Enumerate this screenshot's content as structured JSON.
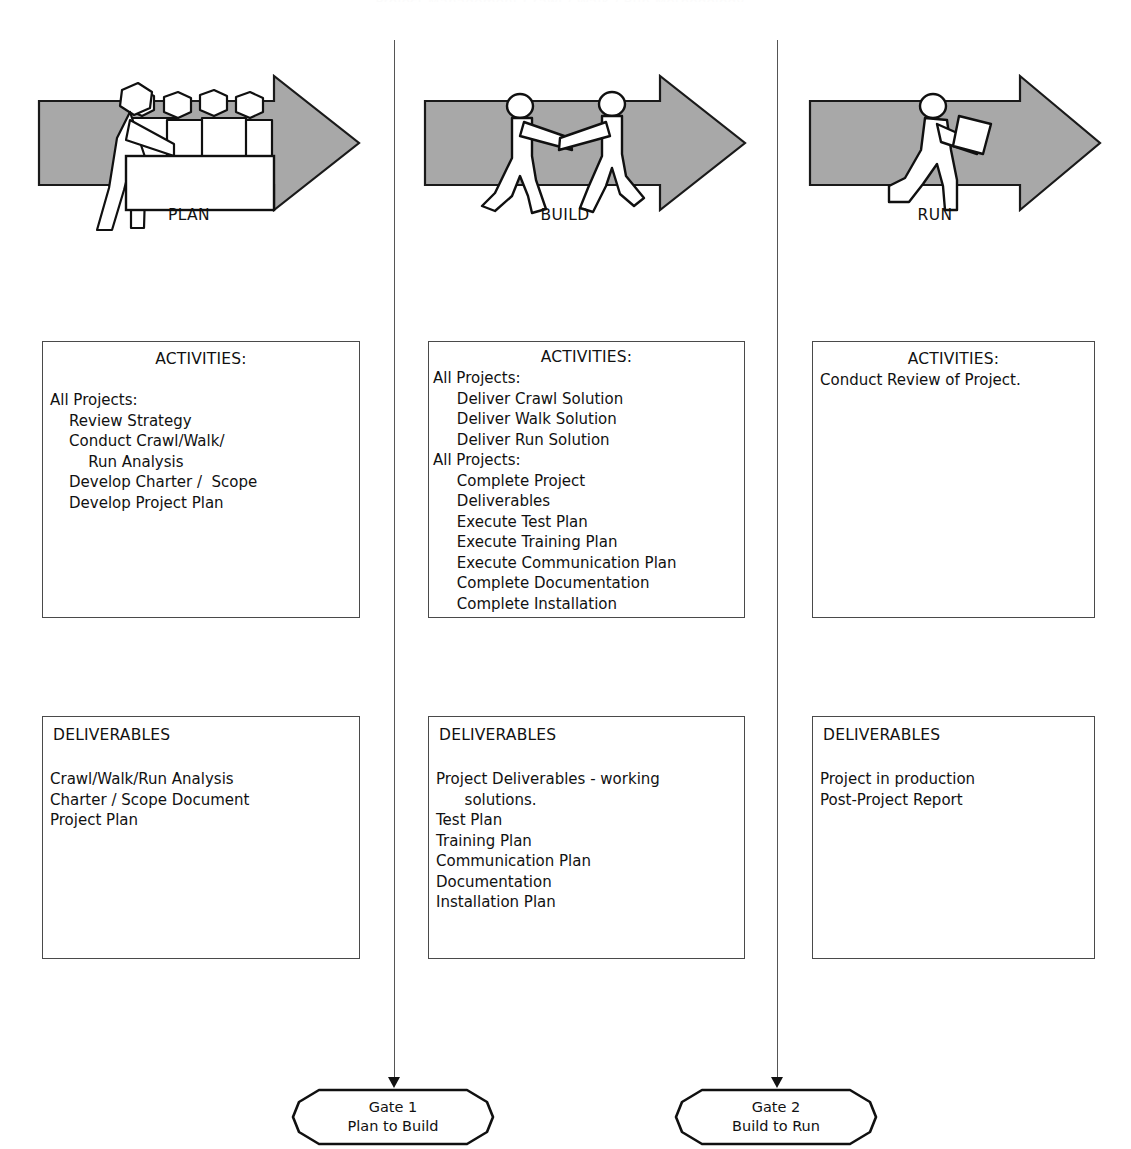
{
  "title_sliver": "Project Management Crawl / Walk / Run Methodology",
  "colors": {
    "arrow_fill": "#a8a8a8",
    "arrow_stroke": "#1a1a1a",
    "figure_fill": "#ffffff",
    "box_border": "#4a4a4a",
    "text": "#111111",
    "divider": "#555555"
  },
  "phases": [
    {
      "label": "PLAN",
      "icon": "meeting-table-people-icon"
    },
    {
      "label": "BUILD",
      "icon": "two-people-building-icon"
    },
    {
      "label": "RUN",
      "icon": "person-carrying-box-icon"
    }
  ],
  "activities": [
    {
      "heading": "ACTIVITIES:",
      "lines": [
        "All Projects:",
        "    Review Strategy",
        "    Conduct Crawl/Walk/",
        "        Run Analysis",
        "    Develop Charter /  Scope",
        "    Develop Project Plan"
      ]
    },
    {
      "heading": "ACTIVITIES:",
      "lines": [
        "All Projects:",
        "     Deliver Crawl Solution",
        "     Deliver Walk Solution",
        "     Deliver Run Solution",
        "All Projects:",
        "     Complete Project",
        "     Deliverables",
        "     Execute Test Plan",
        "     Execute Training Plan",
        "     Execute Communication Plan",
        "     Complete Documentation",
        "     Complete Installation"
      ]
    },
    {
      "heading": "ACTIVITIES:",
      "lines": [
        "Conduct Review of Project."
      ]
    }
  ],
  "deliverables": [
    {
      "heading": "DELIVERABLES",
      "lines": [
        "Crawl/Walk/Run Analysis",
        "Charter / Scope Document",
        "Project Plan"
      ]
    },
    {
      "heading": "DELIVERABLES",
      "lines": [
        "Project Deliverables - working",
        "      solutions.",
        "Test Plan",
        "Training Plan",
        "Communication Plan",
        "Documentation",
        "Installation Plan"
      ]
    },
    {
      "heading": "DELIVERABLES",
      "lines": [
        "Project in production",
        "Post-Project Report"
      ]
    }
  ],
  "gates": [
    {
      "name": "Gate 1",
      "transition": "Plan to Build"
    },
    {
      "name": "Gate 2",
      "transition": "Build to Run"
    }
  ]
}
